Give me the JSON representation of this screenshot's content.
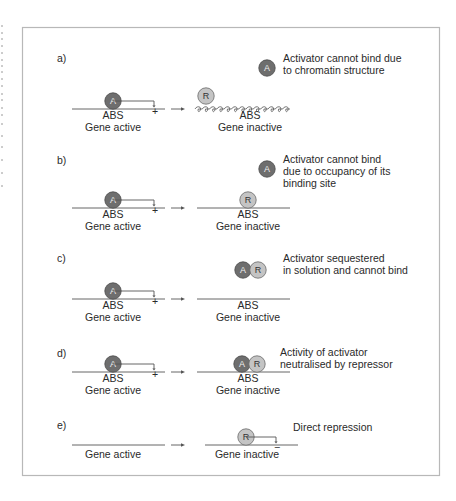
{
  "figure": {
    "panels": [
      {
        "id": "a",
        "label": "a)",
        "legend": "Activator cannot bind due|to chromatin structure",
        "legend_lines": [
          "Activator cannot bind due",
          "to chromatin structure"
        ],
        "legend_icons": [
          "activator"
        ],
        "left": {
          "site_label": "ABS",
          "state": "Gene active",
          "factor": "A",
          "sign": "+"
        },
        "right": {
          "site_label": "ABS",
          "state": "Gene inactive",
          "factors": [
            "R"
          ],
          "dna": "chromatin",
          "sign": ""
        }
      },
      {
        "id": "b",
        "label": "b)",
        "legend_lines": [
          "Activator cannot bind",
          "due to occupancy of its",
          "binding site"
        ],
        "legend_icons": [
          "activator"
        ],
        "left": {
          "site_label": "ABS",
          "state": "Gene active",
          "factor": "A",
          "sign": "+"
        },
        "right": {
          "site_label": "ABS",
          "state": "Gene inactive",
          "factors": [
            "R"
          ],
          "dna": "linear",
          "sign": ""
        }
      },
      {
        "id": "c",
        "label": "c)",
        "legend_lines": [
          "Activator sequestered",
          "in solution and cannot bind"
        ],
        "legend_icons": [
          "activator",
          "repressor"
        ],
        "left": {
          "site_label": "ABS",
          "state": "Gene active",
          "factor": "A",
          "sign": "+"
        },
        "right": {
          "site_label": "ABS",
          "state": "Gene inactive",
          "factors": [],
          "dna": "linear",
          "sign": ""
        }
      },
      {
        "id": "d",
        "label": "d)",
        "legend_lines": [
          "Activity of activator",
          "neutralised by repressor"
        ],
        "legend_icons": [],
        "left": {
          "site_label": "ABS",
          "state": "Gene active",
          "factor": "A",
          "sign": "+"
        },
        "right": {
          "site_label": "ABS",
          "state": "Gene inactive",
          "factors": [
            "A",
            "R"
          ],
          "dna": "linear",
          "sign": ""
        }
      },
      {
        "id": "e",
        "label": "e)",
        "legend_lines": [
          "Direct repression"
        ],
        "legend_icons": [],
        "left": {
          "site_label": "",
          "state": "Gene active",
          "factor": "",
          "sign": ""
        },
        "right": {
          "site_label": "",
          "state": "Gene inactive",
          "factors": [
            "R"
          ],
          "dna": "linear",
          "sign": "−"
        }
      }
    ],
    "symbols": {
      "activator_letter": "A",
      "repressor_letter": "R"
    },
    "colors": {
      "activator_fill": "#6e6e6e",
      "activator_stroke": "#4a4a4a",
      "repressor_fill": "#c4c4c4",
      "repressor_stroke": "#6a6a6a",
      "line": "#555555",
      "frame": "#b8b8b8",
      "text": "#2a2a2a"
    }
  }
}
